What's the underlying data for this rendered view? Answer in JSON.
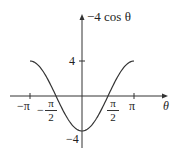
{
  "chart_data": {
    "type": "line",
    "title": "",
    "function": "-4 cos θ",
    "xlabel": "θ",
    "ylabel": "−4 cos θ",
    "xlim": [
      -3.14159,
      3.14159
    ],
    "ylim": [
      -4,
      4
    ],
    "x_ticks": [
      "−π",
      "−π/2",
      "π/2",
      "π"
    ],
    "y_ticks": [
      "4",
      "−4"
    ],
    "grid": false,
    "series": [
      {
        "name": "−4 cos θ",
        "x": [
          -3.1416,
          -2.3562,
          -1.5708,
          -0.7854,
          0,
          0.7854,
          1.5708,
          2.3562,
          3.1416
        ],
        "y": [
          4,
          2.83,
          0,
          -2.83,
          -4,
          -2.83,
          0,
          2.83,
          4
        ]
      }
    ]
  },
  "labels": {
    "y_axis": "−4 cos θ",
    "x_axis": "θ",
    "tick_neg_pi": "−π",
    "tick_pi": "π",
    "tick_half_num": "π",
    "tick_half_den": "2",
    "tick_neg_sign": "−",
    "tick_y_pos": "4",
    "tick_y_neg": "−4"
  }
}
